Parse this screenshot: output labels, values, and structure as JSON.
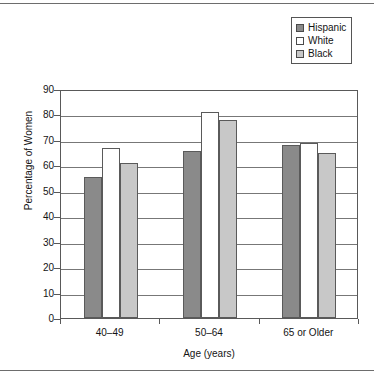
{
  "chart_data": {
    "type": "bar",
    "title": "",
    "xlabel": "Age (years)",
    "ylabel": "Percentage of Women",
    "categories": [
      "40–49",
      "50–64",
      "65 or Older"
    ],
    "series": [
      {
        "name": "Hispanic",
        "color": "#8a8a8a",
        "values": [
          55.5,
          65.5,
          68.0
        ]
      },
      {
        "name": "White",
        "color": "#ffffff",
        "values": [
          67.0,
          81.0,
          68.8
        ]
      },
      {
        "name": "Black",
        "color": "#c8c8c8",
        "values": [
          61.0,
          78.0,
          65.0
        ]
      }
    ],
    "ylim": [
      0,
      90
    ],
    "ytick_step": 10,
    "yticks": [
      "90",
      "80",
      "70",
      "60",
      "50",
      "40",
      "30",
      "20",
      "10",
      "0"
    ],
    "grid": true,
    "legend_position": "top-right"
  },
  "legend": {
    "items": [
      {
        "label": "Hispanic",
        "swatch": "#8a8a8a"
      },
      {
        "label": "White",
        "swatch": "#ffffff"
      },
      {
        "label": "Black",
        "swatch": "#c8c8c8"
      }
    ]
  },
  "axes": {
    "y_title": "Percentage of Women",
    "x_title": "Age (years)"
  }
}
